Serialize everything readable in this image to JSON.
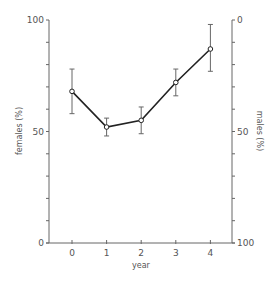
{
  "chart_data": {
    "type": "line",
    "title": "",
    "xlabel": "year",
    "ylabel": "females (%)",
    "y2label": "males (%)",
    "categories": [
      "0",
      "1",
      "2",
      "3",
      "4"
    ],
    "x": [
      0,
      1,
      2,
      3,
      4
    ],
    "series": [
      {
        "name": "females (%)",
        "values": [
          68,
          52,
          55,
          72,
          87
        ],
        "error_low": [
          58,
          48,
          49,
          66,
          77
        ],
        "error_high": [
          78,
          56,
          61,
          78,
          98
        ]
      }
    ],
    "ylim": [
      0,
      100
    ],
    "y2lim": [
      100,
      0
    ],
    "y2_inverted": true,
    "yticks_labeled": [
      0,
      50,
      100
    ],
    "yticks_minor_step": 10,
    "y2ticks_labeled": [
      0,
      50,
      100
    ],
    "xticks": [
      0,
      1,
      2,
      3,
      4
    ],
    "grid": false,
    "legend": null,
    "marker": "open-circle",
    "error_bars": true
  },
  "axes": {
    "x_tick_labels": [
      "0",
      "1",
      "2",
      "3",
      "4"
    ],
    "y_left_labels": [
      "0",
      "50",
      "100"
    ],
    "y_right_labels": [
      "0",
      "50",
      "100"
    ]
  },
  "colors": {
    "line": "#222222",
    "axis": "#666666",
    "text": "#555555",
    "background": "#ffffff"
  }
}
